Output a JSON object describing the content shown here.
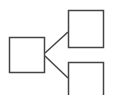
{
  "diagram": {
    "type": "tree-hierarchy",
    "stroke_color": "#444444",
    "background": "#ffffff",
    "nodes": [
      {
        "id": "root",
        "label": ""
      },
      {
        "id": "child-top",
        "label": ""
      },
      {
        "id": "child-bottom",
        "label": ""
      }
    ],
    "edges": [
      {
        "from": "root",
        "to": "child-top"
      },
      {
        "from": "root",
        "to": "child-bottom"
      }
    ]
  }
}
